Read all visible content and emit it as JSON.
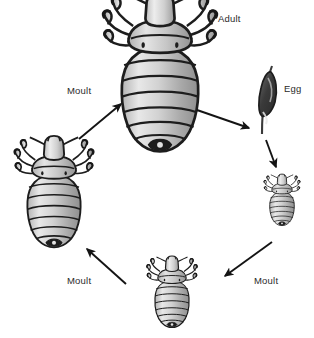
{
  "diagram": {
    "type": "cycle-diagram",
    "colors": {
      "background": "#ffffff",
      "body_fill_light": "#e4e4e4",
      "body_fill_mid": "#c9c9c9",
      "body_fill_dark": "#9d9d9d",
      "outline": "#1d1d1d",
      "claw_dark": "#181818",
      "label_text": "#2a2a2a",
      "arrow": "#141414"
    },
    "labels": {
      "adult": "Adult",
      "egg": "Egg",
      "moult_top_left": "Moult",
      "moult_bottom_left": "Moult",
      "moult_bottom_right": "Moult"
    },
    "stages": [
      {
        "id": "adult",
        "name": "Adult louse",
        "label": "Adult",
        "size": "largest",
        "position": {
          "cx": 160,
          "cy": 72
        },
        "segments": 7,
        "leg_pairs": 3
      },
      {
        "id": "egg",
        "name": "Egg on hair shaft",
        "label": "Egg",
        "size": "tiny",
        "position": {
          "cx": 268,
          "cy": 100
        },
        "segments": 0,
        "leg_pairs": 0
      },
      {
        "id": "nymph-1",
        "name": "First instar nymph",
        "label": "",
        "size": "small",
        "position": {
          "cx": 282,
          "cy": 200
        },
        "segments": 6,
        "leg_pairs": 3
      },
      {
        "id": "nymph-2",
        "name": "Second instar nymph",
        "label": "",
        "size": "medium",
        "position": {
          "cx": 172,
          "cy": 292
        },
        "segments": 6,
        "leg_pairs": 3
      },
      {
        "id": "nymph-3",
        "name": "Third instar nymph",
        "label": "",
        "size": "large",
        "position": {
          "cx": 54,
          "cy": 192
        },
        "segments": 7,
        "leg_pairs": 3
      }
    ],
    "arrows": [
      {
        "id": "arrow-nymph3-to-adult",
        "from": "nymph-3",
        "to": "adult",
        "label": "Moult",
        "direction": "up-right"
      },
      {
        "id": "arrow-adult-to-egg",
        "from": "adult",
        "to": "egg",
        "label": "",
        "direction": "down-right"
      },
      {
        "id": "arrow-egg-to-nymph1",
        "from": "egg",
        "to": "nymph-1",
        "label": "",
        "direction": "down"
      },
      {
        "id": "arrow-nymph1-to-nymph2",
        "from": "nymph-1",
        "to": "nymph-2",
        "label": "Moult",
        "direction": "down-left"
      },
      {
        "id": "arrow-nymph2-to-nymph3",
        "from": "nymph-2",
        "to": "nymph-3",
        "label": "Moult",
        "direction": "up-left"
      }
    ]
  }
}
